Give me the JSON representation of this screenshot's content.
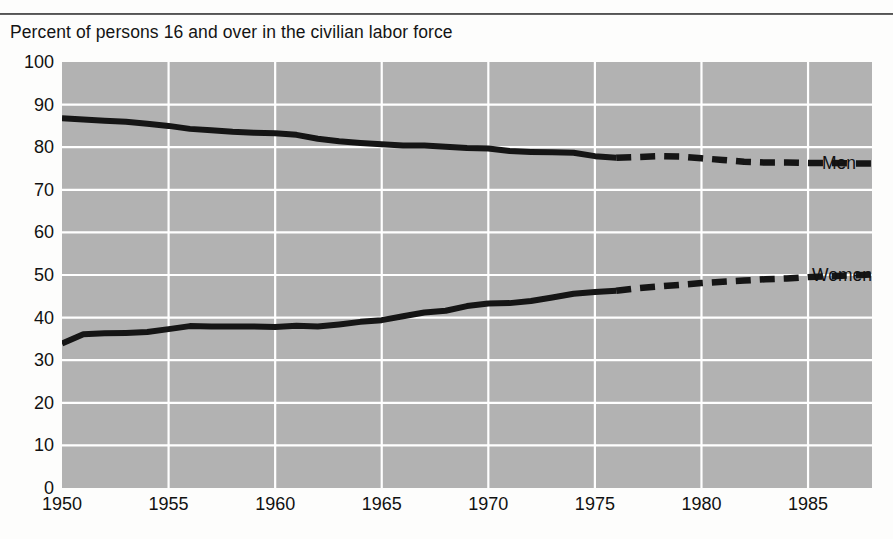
{
  "chart_data": {
    "type": "line",
    "title": "Percent of persons 16 and over in the civilian labor force",
    "xlabel": "",
    "ylabel": "",
    "xlim": [
      1950,
      1988
    ],
    "ylim": [
      0,
      100
    ],
    "grid": true,
    "legend_position": "inline-right",
    "x_ticks": [
      1950,
      1955,
      1960,
      1965,
      1970,
      1975,
      1980,
      1985
    ],
    "y_ticks": [
      0,
      10,
      20,
      30,
      40,
      50,
      60,
      70,
      80,
      90,
      100
    ],
    "plot_background": "#b2b2b2",
    "gridline_color": "#ffffff",
    "line_color": "#151515",
    "series": [
      {
        "name": "Men",
        "label": "Men",
        "style": "solid-then-dashed",
        "projection_start_year": 1976,
        "x": [
          1950,
          1951,
          1952,
          1953,
          1954,
          1955,
          1956,
          1957,
          1958,
          1959,
          1960,
          1961,
          1962,
          1963,
          1964,
          1965,
          1966,
          1967,
          1968,
          1969,
          1970,
          1971,
          1972,
          1973,
          1974,
          1975,
          1976,
          1977,
          1978,
          1979,
          1980,
          1981,
          1982,
          1983,
          1984,
          1985,
          1986,
          1987,
          1988
        ],
        "values": [
          86.8,
          86.5,
          86.2,
          86.0,
          85.5,
          85.0,
          84.3,
          84.0,
          83.6,
          83.4,
          83.3,
          82.9,
          82.0,
          81.4,
          81.0,
          80.7,
          80.4,
          80.4,
          80.1,
          79.8,
          79.7,
          79.1,
          78.9,
          78.8,
          78.7,
          77.9,
          77.5,
          77.7,
          77.9,
          77.8,
          77.4,
          77.0,
          76.6,
          76.4,
          76.4,
          76.3,
          76.3,
          76.2,
          76.2
        ]
      },
      {
        "name": "Women",
        "label": "Women",
        "style": "solid-then-dashed",
        "projection_start_year": 1976,
        "x": [
          1950,
          1951,
          1952,
          1953,
          1954,
          1955,
          1956,
          1957,
          1958,
          1959,
          1960,
          1961,
          1962,
          1963,
          1964,
          1965,
          1966,
          1967,
          1968,
          1969,
          1970,
          1971,
          1972,
          1973,
          1974,
          1975,
          1976,
          1977,
          1978,
          1979,
          1980,
          1981,
          1982,
          1983,
          1984,
          1985,
          1986,
          1987,
          1988
        ],
        "values": [
          33.9,
          36.1,
          36.3,
          36.4,
          36.6,
          37.3,
          38.0,
          37.9,
          37.9,
          37.9,
          37.8,
          38.1,
          37.9,
          38.4,
          39.0,
          39.4,
          40.3,
          41.2,
          41.6,
          42.7,
          43.3,
          43.4,
          43.9,
          44.7,
          45.6,
          46.0,
          46.3,
          46.9,
          47.3,
          47.7,
          48.1,
          48.4,
          48.7,
          49.0,
          49.2,
          49.5,
          49.7,
          49.9,
          50.1
        ]
      }
    ]
  },
  "axis": {
    "y_ticks": [
      "100",
      "90",
      "80",
      "70",
      "60",
      "50",
      "40",
      "30",
      "20",
      "10",
      "0"
    ],
    "x_ticks": [
      "1950",
      "1955",
      "1960",
      "1965",
      "1970",
      "1975",
      "1980",
      "1985"
    ]
  },
  "labels": {
    "men": "Men",
    "women": "Women"
  }
}
